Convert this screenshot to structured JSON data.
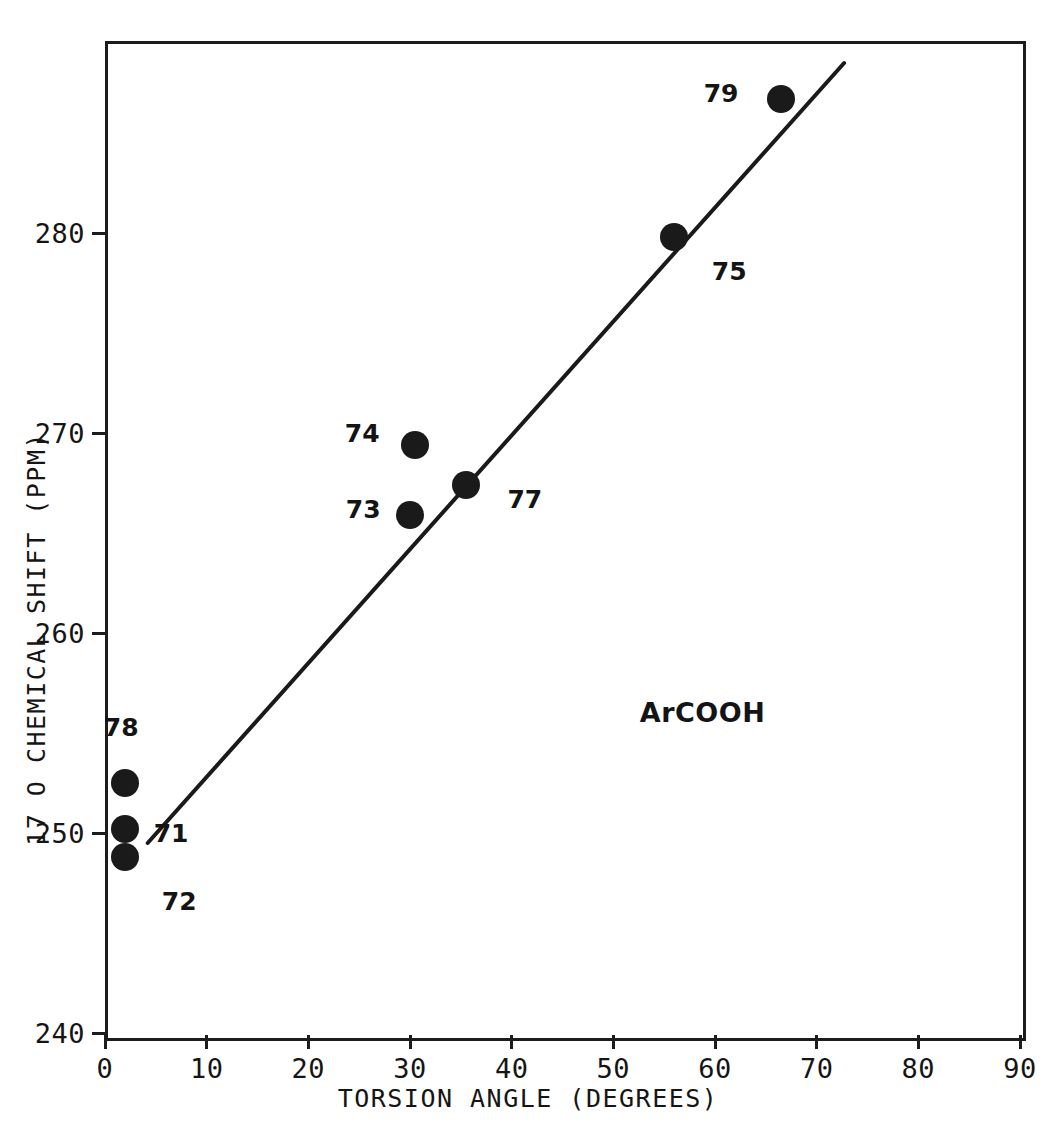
{
  "chart_data": {
    "type": "scatter",
    "title": "",
    "xlabel": "TORSION ANGLE (DEGREES)",
    "ylabel_isotope": "17",
    "ylabel_element": "O",
    "ylabel_rest": "CHEMICAL SHIFT (PPM)",
    "ylabel_full": "17 O CHEMICAL SHIFT (PPM)",
    "xlim": [
      0,
      90
    ],
    "ylim": [
      240,
      288
    ],
    "xticks": [
      0,
      10,
      20,
      30,
      40,
      50,
      60,
      70,
      80,
      90
    ],
    "xticklabels": [
      "0",
      "10",
      "20",
      "30",
      "40",
      "50",
      "60",
      "70",
      "80",
      "90"
    ],
    "yticks": [
      240,
      250,
      260,
      270,
      280
    ],
    "yticklabels": [
      "240",
      "250",
      "260",
      "270",
      "280"
    ],
    "grid": false,
    "legend": "none",
    "marker_color": "#1a1a1a",
    "line_color": "#1a1a1a",
    "frame_color": "#1c1c1c",
    "series": [
      {
        "name": "ArCOOH",
        "annotation": "ArCOOH",
        "annotation_x": 52.6,
        "annotation_y": 256.0,
        "points": [
          {
            "label": "78",
            "x": 2.0,
            "y": 252.5,
            "label_x": 1.6,
            "label_y": 255.3
          },
          {
            "label": "71",
            "x": 2.0,
            "y": 250.2,
            "label_x": 6.5,
            "label_y": 250.0
          },
          {
            "label": "72",
            "x": 2.0,
            "y": 248.8,
            "label_x": 7.3,
            "label_y": 246.6
          },
          {
            "label": "73",
            "x": 30.0,
            "y": 265.9,
            "label_x": 25.4,
            "label_y": 266.2
          },
          {
            "label": "74",
            "x": 30.5,
            "y": 269.4,
            "label_x": 25.3,
            "label_y": 270.0
          },
          {
            "label": "77",
            "x": 35.5,
            "y": 267.4,
            "label_x": 41.3,
            "label_y": 266.7
          },
          {
            "label": "75",
            "x": 56.0,
            "y": 279.8,
            "label_x": 61.4,
            "label_y": 278.1
          },
          {
            "label": "79",
            "x": 66.5,
            "y": 286.7,
            "label_x": 60.6,
            "label_y": 287.0
          }
        ]
      }
    ],
    "trendline": {
      "type": "linear-fit",
      "x_start": 4.2,
      "y_start": 249.5,
      "x_end": 72.7,
      "y_end": 288.5
    }
  }
}
